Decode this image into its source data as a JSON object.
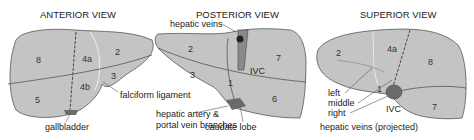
{
  "figure": {
    "panels": [
      {
        "title": "ANTERIOR VIEW",
        "segments": [
          "8",
          "4a",
          "2",
          "3",
          "4b",
          "5"
        ],
        "labels": [
          "falciform ligament",
          "gallbladder"
        ]
      },
      {
        "title": "POSTERIOR VIEW",
        "segments": [
          "2",
          "3",
          "1",
          "7",
          "6"
        ],
        "labels": [
          "hepatic veins",
          "IVC",
          "hepatic artery &",
          "portal vein branches",
          "caudate lobe"
        ]
      },
      {
        "title": "SUPERIOR VIEW",
        "segments": [
          "2",
          "4a",
          "8",
          "1",
          "7"
        ],
        "labels": [
          "left",
          "middle",
          "right",
          "IVC",
          "hepatic veins (projected)"
        ]
      }
    ],
    "colors": {
      "liver_fill": "#c4c4c4",
      "outline": "#555555",
      "dark_structure": "#6a6a6a",
      "background": "#ffffff"
    }
  }
}
